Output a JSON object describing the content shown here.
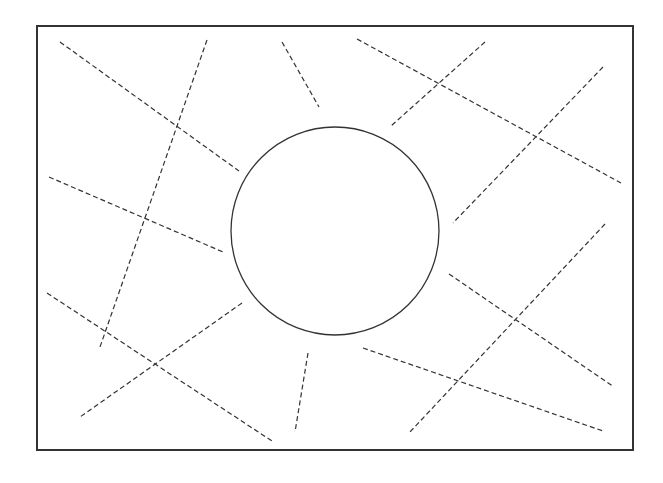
{
  "diagram": {
    "width": 663,
    "height": 483,
    "stroke_color": "#333333",
    "frame": {
      "x": 37,
      "y": 26,
      "width": 596,
      "height": 424
    },
    "circle": {
      "cx": 335,
      "cy": 231,
      "r": 104
    },
    "dashed_lines": [
      {
        "x1": 60,
        "y1": 42,
        "x2": 239,
        "y2": 171
      },
      {
        "x1": 207,
        "y1": 40,
        "x2": 100,
        "y2": 347
      },
      {
        "x1": 282,
        "y1": 42,
        "x2": 319,
        "y2": 107
      },
      {
        "x1": 49,
        "y1": 177,
        "x2": 223,
        "y2": 252
      },
      {
        "x1": 357,
        "y1": 39,
        "x2": 621,
        "y2": 183
      },
      {
        "x1": 485,
        "y1": 42,
        "x2": 391,
        "y2": 126
      },
      {
        "x1": 603,
        "y1": 67,
        "x2": 453,
        "y2": 223
      },
      {
        "x1": 47,
        "y1": 293,
        "x2": 272,
        "y2": 441
      },
      {
        "x1": 242,
        "y1": 303,
        "x2": 80,
        "y2": 417
      },
      {
        "x1": 308,
        "y1": 353,
        "x2": 295,
        "y2": 432
      },
      {
        "x1": 449,
        "y1": 274,
        "x2": 614,
        "y2": 387
      },
      {
        "x1": 605,
        "y1": 224,
        "x2": 409,
        "y2": 433
      },
      {
        "x1": 363,
        "y1": 348,
        "x2": 603,
        "y2": 431
      }
    ]
  }
}
